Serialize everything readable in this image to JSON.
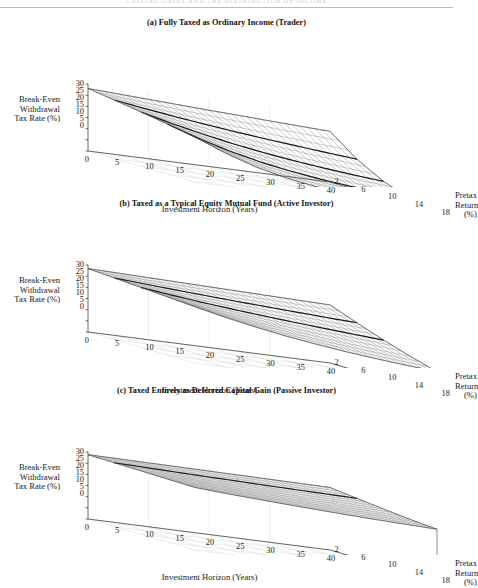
{
  "running_head": {
    "text": "CAPITAL  GAINS  AND  THE  DISTRIBUTION  OF  INCOME"
  },
  "axes": {
    "z_title_lines": [
      "Break-Even",
      "Withdrawal",
      "Tax Rate (%)"
    ],
    "z_ticks": [
      "30",
      "25",
      "20",
      "15",
      "10",
      "5",
      "0"
    ],
    "x_title": "Investment Horizon (Years)",
    "x_ticks": [
      "0",
      "5",
      "10",
      "15",
      "20",
      "25",
      "30",
      "35",
      "40"
    ],
    "y_title_lines": [
      "Pretax",
      "Return",
      "(%)"
    ],
    "y_ticks": [
      "2",
      "6",
      "10",
      "14",
      "18"
    ]
  },
  "panels": [
    {
      "id": "a",
      "title": "(a) Fully Taxed as Ordinary Income (Trader)"
    },
    {
      "id": "b",
      "title": "(b) Taxed as a Typical Equity Mutual Fund (Active Investor)"
    },
    {
      "id": "c",
      "title": "(c) Taxed Entirely as Deferred Capital Gain (Passive Investor)"
    }
  ],
  "style": {
    "mesh_color": "#8a8a8a",
    "contour_color": "#1a1a1a",
    "frame_color": "#3a3a3a",
    "grid_floor_color": "#d8d8d8"
  },
  "chart_data": [
    {
      "type": "surface",
      "panel": "a",
      "title": "(a) Fully Taxed as Ordinary Income (Trader)",
      "xlabel": "Investment Horizon (Years)",
      "ylabel": "Pretax Return (%)",
      "zlabel": "Break-Even Withdrawal Tax Rate (%)",
      "xlim": [
        0,
        40
      ],
      "ylim": [
        2,
        18
      ],
      "zlim": [
        0,
        30
      ],
      "x": [
        0,
        5,
        10,
        15,
        20,
        25,
        30,
        35,
        40
      ],
      "y": [
        2,
        6,
        10,
        14,
        18
      ],
      "grid": true,
      "legend": "none",
      "z": [
        [
          28.0,
          26.2,
          24.3,
          22.3,
          20.3
        ],
        [
          27.3,
          24.2,
          21.0,
          17.8,
          14.7
        ],
        [
          26.6,
          22.3,
          18.1,
          14.0,
          10.3
        ],
        [
          25.9,
          20.6,
          15.5,
          10.9,
          7.1
        ],
        [
          25.2,
          19.0,
          13.3,
          8.5,
          4.9
        ],
        [
          24.6,
          17.5,
          11.4,
          6.6,
          3.4
        ],
        [
          23.9,
          16.2,
          9.8,
          5.1,
          2.3
        ],
        [
          23.3,
          14.9,
          8.4,
          4.0,
          1.6
        ],
        [
          22.7,
          13.7,
          7.2,
          3.1,
          1.1
        ]
      ],
      "contour_rows": [
        1,
        2,
        3
      ],
      "notes": "Surface falls steeply with both horizon and pretax return; heaviest tax drag case."
    },
    {
      "type": "surface",
      "panel": "b",
      "title": "(b) Taxed as a Typical Equity Mutual Fund (Active Investor)",
      "xlabel": "Investment Horizon (Years)",
      "ylabel": "Pretax Return (%)",
      "zlabel": "Break-Even Withdrawal Tax Rate (%)",
      "xlim": [
        0,
        40
      ],
      "ylim": [
        2,
        18
      ],
      "zlim": [
        0,
        30
      ],
      "x": [
        0,
        5,
        10,
        15,
        20,
        25,
        30,
        35,
        40
      ],
      "y": [
        2,
        6,
        10,
        14,
        18
      ],
      "grid": true,
      "legend": "none",
      "z": [
        [
          28.4,
          27.6,
          26.8,
          26.0,
          25.2
        ],
        [
          28.1,
          26.7,
          25.2,
          23.7,
          22.2
        ],
        [
          27.8,
          25.8,
          23.7,
          21.6,
          19.6
        ],
        [
          27.5,
          25.0,
          22.4,
          19.8,
          17.3
        ],
        [
          27.2,
          24.2,
          21.2,
          18.2,
          15.4
        ],
        [
          26.9,
          23.5,
          20.1,
          16.8,
          13.7
        ],
        [
          26.6,
          22.8,
          19.1,
          15.5,
          12.3
        ],
        [
          26.3,
          22.1,
          18.1,
          14.4,
          11.1
        ],
        [
          26.0,
          21.5,
          17.2,
          13.4,
          10.0
        ]
      ],
      "contour_rows": [
        1,
        2
      ],
      "notes": "Moderate decline; surface markedly flatter than panel (a)."
    },
    {
      "type": "surface",
      "panel": "c",
      "title": "(c) Taxed Entirely as Deferred Capital Gain (Passive Investor)",
      "xlabel": "Investment Horizon (Years)",
      "ylabel": "Pretax Return (%)",
      "zlabel": "Break-Even Withdrawal Tax Rate (%)",
      "xlim": [
        0,
        40
      ],
      "ylim": [
        2,
        18
      ],
      "zlim": [
        0,
        30
      ],
      "x": [
        0,
        5,
        10,
        15,
        20,
        25,
        30,
        35,
        40
      ],
      "y": [
        2,
        6,
        10,
        14,
        18
      ],
      "grid": true,
      "legend": "none",
      "z": [
        [
          28.8,
          28.6,
          28.4,
          28.2,
          28.0
        ],
        [
          28.7,
          28.3,
          27.9,
          27.5,
          27.1
        ],
        [
          28.6,
          28.0,
          27.4,
          26.9,
          26.4
        ],
        [
          28.5,
          27.7,
          27.0,
          26.3,
          25.7
        ],
        [
          28.4,
          27.5,
          26.6,
          25.8,
          25.1
        ],
        [
          28.3,
          27.2,
          26.2,
          25.3,
          24.5
        ],
        [
          28.2,
          27.0,
          25.9,
          24.9,
          24.0
        ],
        [
          28.1,
          26.8,
          25.6,
          24.5,
          23.6
        ],
        [
          28.0,
          26.6,
          25.3,
          24.1,
          23.2
        ]
      ],
      "contour_rows": [
        1
      ],
      "notes": "Nearly flat high plateau; deferral keeps break-even rate close to the statutory rate."
    }
  ]
}
